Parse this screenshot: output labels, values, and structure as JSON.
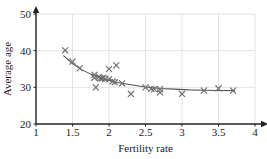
{
  "chart_data": {
    "type": "scatter",
    "title": "",
    "xlabel": "Fertility rate",
    "ylabel": "Average age",
    "xlim": [
      1,
      4
    ],
    "ylim": [
      20,
      50
    ],
    "xticks": [
      1,
      1.5,
      2,
      2.5,
      3,
      3.5,
      4
    ],
    "xticklabels": [
      "1",
      "1.5",
      "2",
      "2.5",
      "3",
      "3.5",
      "4"
    ],
    "yticks": [
      20,
      30,
      40,
      50
    ],
    "yticklabels": [
      "20",
      "30",
      "40",
      "50"
    ],
    "grid": true,
    "legend": "none",
    "marker": "x",
    "marker_color": "#6e6e6e",
    "curve_color": "#555555",
    "axis_color": "#222222",
    "grid_color": "#dcdcdc",
    "points": [
      {
        "x": 1.4,
        "y": 40.1
      },
      {
        "x": 1.5,
        "y": 37.0
      },
      {
        "x": 1.6,
        "y": 35.2
      },
      {
        "x": 1.8,
        "y": 33.4
      },
      {
        "x": 1.8,
        "y": 32.6
      },
      {
        "x": 1.82,
        "y": 30.0
      },
      {
        "x": 1.86,
        "y": 32.8
      },
      {
        "x": 1.88,
        "y": 32.5
      },
      {
        "x": 1.9,
        "y": 32.4
      },
      {
        "x": 1.92,
        "y": 32.6
      },
      {
        "x": 1.95,
        "y": 32.3
      },
      {
        "x": 2.0,
        "y": 35.0
      },
      {
        "x": 2.0,
        "y": 32.2
      },
      {
        "x": 2.05,
        "y": 31.6
      },
      {
        "x": 2.08,
        "y": 31.4
      },
      {
        "x": 2.1,
        "y": 36.0
      },
      {
        "x": 2.18,
        "y": 31.1
      },
      {
        "x": 2.3,
        "y": 28.2
      },
      {
        "x": 2.5,
        "y": 30.0
      },
      {
        "x": 2.58,
        "y": 29.6
      },
      {
        "x": 2.62,
        "y": 29.5
      },
      {
        "x": 2.7,
        "y": 29.5
      },
      {
        "x": 2.7,
        "y": 28.6
      },
      {
        "x": 3.0,
        "y": 28.2
      },
      {
        "x": 3.3,
        "y": 29.1
      },
      {
        "x": 3.5,
        "y": 29.7
      },
      {
        "x": 3.7,
        "y": 29.1
      }
    ],
    "fit_curve": [
      {
        "x": 1.38,
        "y": 38.6
      },
      {
        "x": 1.5,
        "y": 36.5
      },
      {
        "x": 1.62,
        "y": 34.9
      },
      {
        "x": 1.75,
        "y": 33.6
      },
      {
        "x": 1.88,
        "y": 32.6
      },
      {
        "x": 2.0,
        "y": 31.9
      },
      {
        "x": 2.15,
        "y": 31.2
      },
      {
        "x": 2.3,
        "y": 30.7
      },
      {
        "x": 2.5,
        "y": 30.1
      },
      {
        "x": 2.7,
        "y": 29.7
      },
      {
        "x": 2.9,
        "y": 29.5
      },
      {
        "x": 3.1,
        "y": 29.3
      },
      {
        "x": 3.3,
        "y": 29.2
      },
      {
        "x": 3.5,
        "y": 29.15
      },
      {
        "x": 3.72,
        "y": 29.1
      }
    ]
  }
}
